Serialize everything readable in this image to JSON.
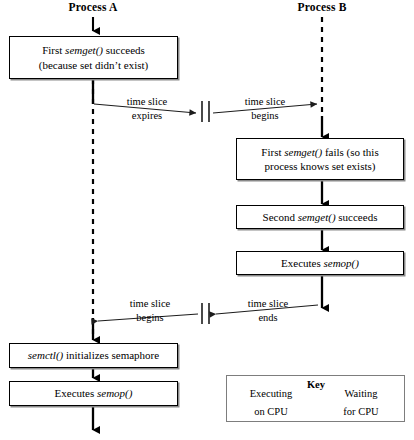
{
  "diagram": {
    "columns": [
      {
        "id": "process-a",
        "label": "Process A"
      },
      {
        "id": "process-b",
        "label": "Process B"
      }
    ],
    "process_a_steps": [
      {
        "id": "a-step-1",
        "line1_pre": "First ",
        "line1_em": "semget()",
        "line1_post": " succeeds",
        "line2": "(because set didn’t exist)"
      },
      {
        "id": "a-step-2",
        "line1_pre": "",
        "line1_em": "semctl()",
        "line1_post": " initializes semaphore",
        "line2": ""
      },
      {
        "id": "a-step-3",
        "line1_pre": "Executes ",
        "line1_em": "semop()",
        "line1_post": "",
        "line2": ""
      }
    ],
    "process_b_steps": [
      {
        "id": "b-step-1",
        "line1_pre": "First ",
        "line1_em": "semget()",
        "line1_post": " fails (so this",
        "line2": "process knows set exists)"
      },
      {
        "id": "b-step-2",
        "line1_pre": "Second ",
        "line1_em": "semget()",
        "line1_post": " succeeds",
        "line2": ""
      },
      {
        "id": "b-step-3",
        "line1_pre": "Executes ",
        "line1_em": "semop()",
        "line1_post": "",
        "line2": ""
      }
    ],
    "transitions": [
      {
        "id": "a-expires",
        "line1": "time slice",
        "line2": "expires"
      },
      {
        "id": "b-begins",
        "line1": "time slice",
        "line2": "begins"
      },
      {
        "id": "a-resumes",
        "line1": "time slice",
        "line2": "begins"
      },
      {
        "id": "b-ends",
        "line1": "time slice",
        "line2": "ends"
      }
    ],
    "key": {
      "title": "Key",
      "executing_line1": "Executing",
      "executing_line2": "on CPU",
      "waiting_line1": "Waiting",
      "waiting_line2": "for CPU"
    },
    "colors": {
      "line": "#000000",
      "box_border": "#000000",
      "box_shadow": "#8a8a8a",
      "key_border": "#7d7d7d",
      "background": "#ffffff",
      "thin_line": "#3a3a3a"
    }
  }
}
